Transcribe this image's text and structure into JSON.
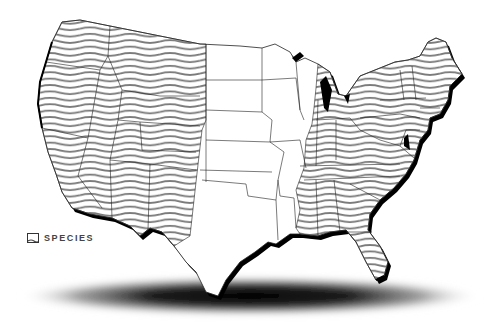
{
  "map": {
    "type": "choropleth-hatched",
    "subject": "United States species range map",
    "colors": {
      "background": "#ffffff",
      "hatch_line": "#7a7a7a",
      "state_border": "#222222",
      "extrusion": "#000000",
      "ground_shadow": "#000000"
    },
    "hatched_regions": [
      "Washington",
      "Oregon",
      "California",
      "Idaho",
      "Nevada",
      "Montana",
      "Wyoming",
      "Utah",
      "Colorado",
      "Arizona",
      "New Mexico",
      "Illinois",
      "Michigan",
      "Indiana",
      "Ohio",
      "Kentucky",
      "Tennessee",
      "Mississippi",
      "Alabama",
      "Georgia",
      "Florida",
      "South Carolina",
      "North Carolina",
      "Virginia",
      "West Virginia",
      "Maryland",
      "Delaware",
      "Pennsylvania",
      "New Jersey",
      "New York",
      "Connecticut",
      "Rhode Island",
      "Massachusetts",
      "Vermont",
      "New Hampshire",
      "Maine"
    ],
    "unhatched_regions": [
      "North Dakota",
      "South Dakota",
      "Nebraska",
      "Kansas",
      "Oklahoma",
      "Texas",
      "Minnesota",
      "Iowa",
      "Missouri",
      "Arkansas",
      "Louisiana",
      "Wisconsin"
    ]
  },
  "legend": {
    "items": [
      {
        "label": "SPECIES",
        "icon": "wavy-hatch-swatch"
      }
    ]
  }
}
